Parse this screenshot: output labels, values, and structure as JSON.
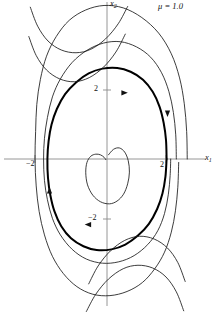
{
  "figure": {
    "name": "van-der-pol-phase-portrait",
    "parameter_label": "μ = 1.0",
    "axis_x_label": "x",
    "axis_x_sub": "1",
    "axis_y_label": "x",
    "axis_y_sub": "2",
    "background_color": "#ffffff",
    "line_color": "#1a1a1a",
    "limit_cycle_color": "#000000",
    "axis_color": "#8a8a8a"
  },
  "ticks": {
    "y_positive": "2",
    "y_negative": "−2",
    "x_negative": "−2",
    "x_positive": "2"
  },
  "chart_data": {
    "type": "line",
    "title": "",
    "subtitle": "",
    "xlabel": "x1",
    "ylabel": "x2",
    "xlim": [
      -3.2,
      3.2
    ],
    "ylim": [
      -4.4,
      4.4
    ],
    "grid": false,
    "legend": null,
    "annotations": [
      {
        "text": "μ = 1.0",
        "x": 2.2,
        "y": 4.2
      },
      {
        "text": "arrow",
        "x": 2.05,
        "y": 1.35,
        "direction": "down"
      },
      {
        "text": "arrow",
        "x": -1.95,
        "y": -0.95,
        "direction": "up"
      },
      {
        "text": "arrow",
        "x": 0.55,
        "y": 1.92,
        "direction": "right"
      },
      {
        "text": "arrow",
        "x": -0.6,
        "y": -1.9,
        "direction": "left"
      }
    ],
    "axis_ticks": {
      "x": [
        -2,
        2
      ],
      "y": [
        -2,
        2
      ]
    },
    "series": [
      {
        "name": "limit-cycle",
        "emphasis": "bold",
        "closed": true,
        "points": [
          [
            2.02,
            0.0
          ],
          [
            2.0,
            0.55
          ],
          [
            1.92,
            1.05
          ],
          [
            1.78,
            1.52
          ],
          [
            1.55,
            1.95
          ],
          [
            1.22,
            2.3
          ],
          [
            0.8,
            2.53
          ],
          [
            0.35,
            2.64
          ],
          [
            -0.15,
            2.62
          ],
          [
            -0.62,
            2.48
          ],
          [
            -1.05,
            2.22
          ],
          [
            -1.42,
            1.88
          ],
          [
            -1.7,
            1.45
          ],
          [
            -1.88,
            1.0
          ],
          [
            -1.98,
            0.52
          ],
          [
            -2.02,
            0.0
          ],
          [
            -2.0,
            -0.55
          ],
          [
            -1.92,
            -1.05
          ],
          [
            -1.78,
            -1.52
          ],
          [
            -1.55,
            -1.95
          ],
          [
            -1.22,
            -2.3
          ],
          [
            -0.8,
            -2.53
          ],
          [
            -0.35,
            -2.64
          ],
          [
            0.15,
            -2.62
          ],
          [
            0.62,
            -2.48
          ],
          [
            1.05,
            -2.22
          ],
          [
            1.42,
            -1.88
          ],
          [
            1.7,
            -1.45
          ],
          [
            1.88,
            -1.0
          ],
          [
            1.98,
            -0.52
          ],
          [
            2.02,
            0.0
          ]
        ]
      },
      {
        "name": "outer-trajectory-1",
        "emphasis": "thin",
        "closed": false,
        "points": [
          [
            2.35,
            0.0
          ],
          [
            2.33,
            0.7
          ],
          [
            2.25,
            1.35
          ],
          [
            2.1,
            1.95
          ],
          [
            1.85,
            2.5
          ],
          [
            1.48,
            2.95
          ],
          [
            1.0,
            3.25
          ],
          [
            0.45,
            3.4
          ],
          [
            -0.12,
            3.36
          ],
          [
            -0.68,
            3.15
          ],
          [
            -1.18,
            2.8
          ],
          [
            -1.58,
            2.32
          ],
          [
            -1.85,
            1.8
          ],
          [
            -2.02,
            1.2
          ],
          [
            -2.12,
            0.6
          ],
          [
            -2.15,
            0.0
          ],
          [
            -2.12,
            -0.62
          ],
          [
            -2.02,
            -1.18
          ],
          [
            -1.85,
            -1.72
          ],
          [
            -1.58,
            -2.2
          ],
          [
            -1.18,
            -2.62
          ],
          [
            -0.7,
            -2.9
          ],
          [
            -0.15,
            -3.02
          ],
          [
            0.4,
            -2.98
          ],
          [
            0.92,
            -2.8
          ],
          [
            1.38,
            -2.48
          ],
          [
            1.72,
            -2.08
          ],
          [
            1.95,
            -1.58
          ],
          [
            2.08,
            -1.02
          ],
          [
            2.14,
            -0.48
          ],
          [
            2.16,
            0.0
          ]
        ]
      },
      {
        "name": "outer-trajectory-2",
        "emphasis": "thin",
        "closed": false,
        "points": [
          [
            2.72,
            0.0
          ],
          [
            2.7,
            0.8
          ],
          [
            2.62,
            1.6
          ],
          [
            2.46,
            2.35
          ],
          [
            2.18,
            3.05
          ],
          [
            1.75,
            3.65
          ],
          [
            1.18,
            4.1
          ],
          [
            0.55,
            4.38
          ],
          [
            -0.1,
            4.45
          ],
          [
            -0.72,
            4.32
          ],
          [
            -1.28,
            4.02
          ],
          [
            -1.72,
            3.55
          ],
          [
            -2.05,
            2.98
          ],
          [
            -2.26,
            2.3
          ],
          [
            -2.38,
            1.58
          ],
          [
            -2.42,
            0.8
          ],
          [
            -2.44,
            0.0
          ],
          [
            -2.4,
            -0.78
          ],
          [
            -2.3,
            -1.52
          ],
          [
            -2.12,
            -2.2
          ],
          [
            -1.85,
            -2.82
          ],
          [
            -1.48,
            -3.32
          ],
          [
            -1.02,
            -3.7
          ],
          [
            -0.48,
            -3.92
          ],
          [
            0.1,
            -3.96
          ],
          [
            0.68,
            -3.84
          ],
          [
            1.2,
            -3.58
          ],
          [
            1.62,
            -3.18
          ],
          [
            1.95,
            -2.7
          ],
          [
            2.18,
            -2.12
          ],
          [
            2.32,
            -1.5
          ],
          [
            2.4,
            -0.82
          ],
          [
            2.43,
            -0.1
          ]
        ]
      },
      {
        "name": "inner-spiral",
        "emphasis": "thin",
        "closed": false,
        "points": [
          [
            0.05,
            0.12
          ],
          [
            0.22,
            0.28
          ],
          [
            0.42,
            0.32
          ],
          [
            0.6,
            0.2
          ],
          [
            0.72,
            -0.05
          ],
          [
            0.76,
            -0.38
          ],
          [
            0.7,
            -0.72
          ],
          [
            0.56,
            -1.02
          ],
          [
            0.34,
            -1.22
          ],
          [
            0.08,
            -1.3
          ],
          [
            -0.22,
            -1.24
          ],
          [
            -0.48,
            -1.05
          ],
          [
            -0.66,
            -0.75
          ],
          [
            -0.72,
            -0.4
          ],
          [
            -0.68,
            -0.1
          ],
          [
            -0.55,
            0.08
          ],
          [
            -0.38,
            0.14
          ],
          [
            -0.22,
            0.12
          ],
          [
            -0.1,
            0.05
          ],
          [
            -0.04,
            -0.02
          ]
        ]
      },
      {
        "name": "field-curve-upper-1",
        "emphasis": "thin",
        "closed": false,
        "points": [
          [
            -2.6,
            4.4
          ],
          [
            -2.35,
            3.85
          ],
          [
            -2.0,
            3.42
          ],
          [
            -1.55,
            3.16
          ],
          [
            -1.05,
            3.08
          ],
          [
            -0.55,
            3.18
          ],
          [
            -0.05,
            3.48
          ],
          [
            0.38,
            3.92
          ],
          [
            0.7,
            4.42
          ]
        ]
      },
      {
        "name": "field-curve-upper-2",
        "emphasis": "thin",
        "closed": false,
        "points": [
          [
            -2.65,
            3.55
          ],
          [
            -2.4,
            3.0
          ],
          [
            -2.05,
            2.58
          ],
          [
            -1.6,
            2.32
          ],
          [
            -1.1,
            2.24
          ],
          [
            -0.6,
            2.36
          ],
          [
            -0.12,
            2.66
          ],
          [
            0.3,
            3.1
          ],
          [
            0.62,
            3.62
          ]
        ]
      },
      {
        "name": "field-curve-lower-1",
        "emphasis": "thin",
        "closed": false,
        "points": [
          [
            -0.62,
            -3.62
          ],
          [
            -0.3,
            -3.1
          ],
          [
            0.12,
            -2.66
          ],
          [
            0.6,
            -2.36
          ],
          [
            1.1,
            -2.24
          ],
          [
            1.6,
            -2.32
          ],
          [
            2.05,
            -2.58
          ],
          [
            2.4,
            -3.0
          ],
          [
            2.65,
            -3.55
          ]
        ]
      },
      {
        "name": "field-curve-lower-2",
        "emphasis": "thin",
        "closed": false,
        "points": [
          [
            -0.7,
            -4.42
          ],
          [
            -0.38,
            -3.92
          ],
          [
            0.05,
            -3.48
          ],
          [
            0.55,
            -3.18
          ],
          [
            1.05,
            -3.08
          ],
          [
            1.55,
            -3.16
          ],
          [
            2.0,
            -3.42
          ],
          [
            2.35,
            -3.85
          ],
          [
            2.6,
            -4.4
          ]
        ]
      }
    ]
  }
}
